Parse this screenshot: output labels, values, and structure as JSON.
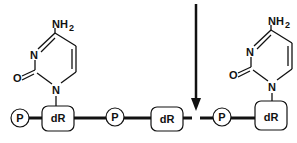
{
  "diagram": {
    "backbone": [
      {
        "type": "phosphate",
        "label": "P"
      },
      {
        "type": "sugar",
        "label": "dR",
        "base": "cytosine"
      },
      {
        "type": "phosphate",
        "label": "P"
      },
      {
        "type": "sugar",
        "label": "dR",
        "base": null
      },
      {
        "type": "break"
      },
      {
        "type": "phosphate",
        "label": "P"
      },
      {
        "type": "sugar",
        "label": "dR",
        "base": "cytosine"
      }
    ],
    "labels": {
      "p1": "P",
      "dr1": "dR",
      "p2": "P",
      "dr2": "dR",
      "p3": "P",
      "dr3": "dR"
    },
    "bases": {
      "left": {
        "name": "cytosine",
        "amine": "NH",
        "amine_sub": "2",
        "n3": "N",
        "n1": "N",
        "oxygen": "O"
      },
      "right": {
        "name": "cytosine",
        "amine": "NH",
        "amine_sub": "2",
        "n3": "N",
        "n1": "N",
        "oxygen": "O"
      }
    },
    "arrow": {
      "meaning": "strand break site",
      "direction": "down"
    },
    "colors": {
      "ink": "#111111",
      "background": "#ffffff"
    }
  }
}
